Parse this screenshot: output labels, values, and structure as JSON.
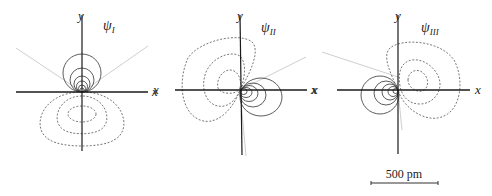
{
  "figure": {
    "panels": [
      {
        "id": "psi_I",
        "psi_symbol": "ψ",
        "psi_subscript": "I",
        "x_label_right": "x",
        "y_label": "y",
        "positive_lobe": "up (+y)",
        "negative_lobe": "down (−y)"
      },
      {
        "id": "psi_II",
        "psi_symbol": "ψ",
        "psi_subscript": "II",
        "x_label_left": "x",
        "x_label_right": "x",
        "y_label": "y",
        "positive_lobe": "right (+x, slightly −y)",
        "negative_lobe": "upper-left"
      },
      {
        "id": "psi_III",
        "psi_symbol": "ψ",
        "psi_subscript": "III",
        "x_label_left": "x",
        "x_label_right": "x",
        "y_label": "y",
        "positive_lobe": "left (−x, slightly −y)",
        "negative_lobe": "upper-right"
      }
    ],
    "legend": {
      "solid_lines": "positive contour",
      "dashed_lines": "negative contour",
      "light_gray_lines": "nodal line"
    },
    "scale_bar": {
      "label": "500 pm"
    },
    "colors": {
      "axis": "#1a1a1a",
      "solid_contour": "#333333",
      "dashed_contour": "#555555",
      "nodal": "#c8c8c8",
      "background": "#ffffff"
    }
  }
}
